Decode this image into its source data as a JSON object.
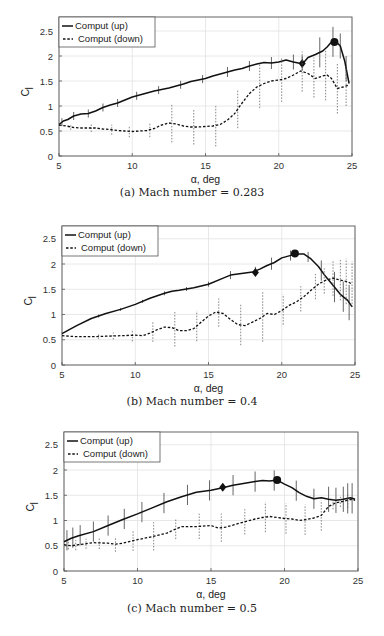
{
  "chart_data": [
    {
      "id": "a",
      "type": "line",
      "caption": "(a) Mach number = 0.283",
      "xlabel": "α, deg",
      "ylabel": "C",
      "ylabel_sub": "l",
      "xlim": [
        5,
        25
      ],
      "ylim": [
        0,
        2.8
      ],
      "xticks": [
        5,
        10,
        15,
        20,
        25
      ],
      "yticks": [
        0,
        0.5,
        1,
        1.5,
        2,
        2.5
      ],
      "grid": true,
      "legend": {
        "position": "upper-left",
        "entries": [
          "Comput (up)",
          "Comput (down)"
        ]
      },
      "frame": {
        "left": 59,
        "right": 352,
        "top": 17,
        "bottom": 156,
        "y0px": 156,
        "pxPerUnit": 50
      },
      "series": [
        {
          "name": "Comput (up)",
          "style": "solid",
          "x": [
            5,
            5.3,
            5.6,
            6,
            6.5,
            7,
            7.5,
            8,
            8.5,
            9,
            9.5,
            10,
            10.5,
            11,
            11.5,
            12,
            12.5,
            13,
            13.5,
            14,
            14.5,
            15,
            15.5,
            16,
            16.5,
            17,
            17.5,
            18,
            18.5,
            19,
            19.5,
            20,
            20.5,
            21,
            21.5,
            21.7,
            22,
            22.5,
            23,
            23.3,
            23.6,
            23.9,
            24.2,
            24.5,
            24.8
          ],
          "y": [
            0.63,
            0.7,
            0.73,
            0.8,
            0.84,
            0.85,
            0.9,
            0.97,
            1.02,
            1.06,
            1.12,
            1.18,
            1.22,
            1.26,
            1.3,
            1.33,
            1.36,
            1.4,
            1.44,
            1.49,
            1.52,
            1.55,
            1.6,
            1.64,
            1.68,
            1.72,
            1.75,
            1.8,
            1.84,
            1.87,
            1.86,
            1.88,
            1.92,
            1.88,
            1.85,
            1.87,
            1.97,
            2.03,
            2.1,
            2.18,
            2.28,
            2.29,
            2.2,
            1.9,
            1.45
          ],
          "error_bars": {
            "x": [
              5.2,
              6,
              7,
              8,
              9,
              10.3,
              11.8,
              13.3,
              14.8,
              16.5,
              18,
              19.5,
              21,
              21.6,
              22.8,
              23.7,
              24.2,
              24.6
            ],
            "half": [
              0.08,
              0.08,
              0.08,
              0.08,
              0.08,
              0.08,
              0.08,
              0.08,
              0.08,
              0.1,
              0.1,
              0.12,
              0.15,
              0.15,
              0.3,
              0.3,
              0.25,
              0.25
            ]
          },
          "markers": [
            {
              "x": 21.6,
              "y": 1.85,
              "shape": "diamond"
            },
            {
              "x": 23.8,
              "y": 2.28,
              "shape": "circle"
            }
          ]
        },
        {
          "name": "Comput (down)",
          "style": "dashed",
          "x": [
            5,
            5.5,
            6,
            6.5,
            7,
            7.5,
            8,
            8.5,
            9,
            9.5,
            10,
            10.5,
            11,
            11.5,
            12,
            12.5,
            13,
            13.5,
            14,
            14.5,
            15,
            15.5,
            16,
            16.5,
            17,
            17.3,
            17.6,
            18,
            18.5,
            19,
            19.5,
            20,
            20.5,
            21,
            21.5,
            22,
            22.5,
            23,
            23.3,
            23.6,
            24,
            24.4,
            24.8
          ],
          "y": [
            0.62,
            0.6,
            0.57,
            0.56,
            0.56,
            0.56,
            0.54,
            0.53,
            0.51,
            0.5,
            0.49,
            0.5,
            0.51,
            0.55,
            0.62,
            0.66,
            0.64,
            0.6,
            0.58,
            0.58,
            0.59,
            0.6,
            0.63,
            0.72,
            0.85,
            0.98,
            1.1,
            1.25,
            1.38,
            1.45,
            1.5,
            1.52,
            1.55,
            1.62,
            1.7,
            1.65,
            1.55,
            1.6,
            1.62,
            1.55,
            1.35,
            1.38,
            1.42
          ],
          "error_bars": {
            "x": [
              5.8,
              7.2,
              8.6,
              9.8,
              11.2,
              12.7,
              14.2,
              15.7,
              17.2,
              18.7,
              20.2,
              21.6,
              22.4,
              23.2,
              24,
              24.6
            ],
            "half": [
              0.06,
              0.08,
              0.1,
              0.12,
              0.15,
              0.38,
              0.35,
              0.42,
              0.38,
              0.45,
              0.45,
              0.4,
              0.4,
              0.5,
              0.5,
              0.4
            ]
          },
          "markers": []
        }
      ]
    },
    {
      "id": "b",
      "type": "line",
      "caption": "(b) Mach number = 0.4",
      "xlabel": "α, deg",
      "ylabel": "C",
      "ylabel_sub": "l",
      "xlim": [
        5,
        25
      ],
      "ylim": [
        0,
        2.8
      ],
      "xticks": [
        5,
        10,
        15,
        20,
        25
      ],
      "yticks": [
        0,
        0.5,
        1,
        1.5,
        2,
        2.5
      ],
      "grid": true,
      "legend": {
        "position": "upper-left",
        "entries": [
          "Comput (up)",
          "Comput (down)"
        ]
      },
      "frame": {
        "left": 62,
        "right": 355,
        "top": 16,
        "bottom": 155,
        "y0px": 155,
        "pxPerUnit": 50.5
      },
      "series": [
        {
          "name": "Comput (up)",
          "style": "solid",
          "x": [
            5,
            5.5,
            6,
            7,
            8,
            9,
            10,
            11,
            12,
            12.5,
            13,
            14,
            15,
            16,
            16.5,
            17,
            17.5,
            18,
            18.5,
            19,
            19.5,
            20,
            20.5,
            21,
            21.5,
            22,
            22.5,
            23,
            23.5,
            24,
            24.5,
            24.8
          ],
          "y": [
            0.62,
            0.7,
            0.78,
            0.92,
            1.02,
            1.1,
            1.2,
            1.32,
            1.42,
            1.46,
            1.48,
            1.53,
            1.6,
            1.72,
            1.78,
            1.8,
            1.82,
            1.84,
            1.9,
            1.97,
            2.03,
            2.12,
            2.16,
            2.2,
            2.2,
            2.1,
            1.95,
            1.75,
            1.58,
            1.4,
            1.28,
            1.15
          ],
          "error_bars": {
            "x": [
              7.5,
              9,
              10.5,
              12,
              13.5,
              15,
              16.5,
              18.2,
              19.3,
              20.6,
              21.8,
              22.7,
              23.6,
              24.2,
              24.6
            ],
            "half": [
              0.03,
              0.03,
              0.03,
              0.04,
              0.04,
              0.05,
              0.08,
              0.08,
              0.12,
              0.1,
              0.1,
              0.2,
              0.3,
              0.3,
              0.35
            ]
          },
          "markers": [
            {
              "x": 18.2,
              "y": 1.83,
              "shape": "diamond"
            },
            {
              "x": 20.9,
              "y": 2.21,
              "shape": "circle"
            }
          ]
        },
        {
          "name": "Comput (down)",
          "style": "dashed",
          "x": [
            5,
            6,
            7,
            8,
            9,
            10,
            10.5,
            11,
            11.5,
            12,
            12.5,
            13,
            13.5,
            14,
            14.5,
            15,
            15.5,
            16,
            16.5,
            17,
            17.5,
            18,
            18.5,
            19,
            19.5,
            20,
            20.5,
            21,
            21.5,
            22,
            22.5,
            23,
            23.5,
            24,
            24.5,
            24.8
          ],
          "y": [
            0.58,
            0.56,
            0.56,
            0.57,
            0.58,
            0.59,
            0.58,
            0.63,
            0.7,
            0.75,
            0.74,
            0.68,
            0.68,
            0.72,
            0.85,
            0.97,
            1.05,
            1.02,
            0.9,
            0.8,
            0.78,
            0.85,
            0.92,
            1.02,
            1.0,
            1.08,
            1.18,
            1.25,
            1.35,
            1.48,
            1.6,
            1.68,
            1.72,
            1.68,
            1.65,
            1.6
          ],
          "error_bars": {
            "x": [
              7.5,
              8.5,
              9.8,
              11.2,
              12.7,
              14.2,
              15.7,
              17.2,
              18.7,
              20.1,
              21.3,
              22.3,
              22.9,
              23.5,
              24,
              24.4,
              24.8
            ],
            "half": [
              0.05,
              0.07,
              0.12,
              0.2,
              0.35,
              0.3,
              0.28,
              0.4,
              0.5,
              0.3,
              0.25,
              0.25,
              0.25,
              0.35,
              0.4,
              0.45,
              0.45
            ]
          },
          "markers": []
        }
      ]
    },
    {
      "id": "c",
      "type": "line",
      "caption": "(c) Mach number = 0.5",
      "xlabel": "α, deg",
      "ylabel": "C",
      "ylabel_sub": "l",
      "xlim": [
        5,
        25
      ],
      "ylim": [
        0,
        2.8
      ],
      "xticks": [
        5,
        10,
        15,
        20,
        25
      ],
      "yticks": [
        0,
        0.5,
        1,
        1.5,
        2,
        2.5
      ],
      "grid": true,
      "legend": {
        "position": "upper-left",
        "entries": [
          "Comput (up)",
          "Comput (down)"
        ]
      },
      "frame": {
        "left": 64,
        "right": 358,
        "top": 16,
        "bottom": 155,
        "y0px": 155,
        "pxPerUnit": 50.5
      },
      "series": [
        {
          "name": "Comput (up)",
          "style": "solid",
          "x": [
            5,
            5.5,
            6,
            7,
            8,
            9,
            10,
            11,
            12,
            13,
            14,
            15,
            15.8,
            16.5,
            17,
            18,
            18.5,
            19,
            19.5,
            20,
            20.5,
            21,
            21.5,
            22,
            22.5,
            23,
            23.5,
            24,
            24.5,
            24.8
          ],
          "y": [
            0.58,
            0.65,
            0.7,
            0.78,
            0.9,
            1.02,
            1.13,
            1.25,
            1.37,
            1.47,
            1.56,
            1.6,
            1.65,
            1.7,
            1.72,
            1.77,
            1.79,
            1.78,
            1.8,
            1.72,
            1.65,
            1.55,
            1.48,
            1.43,
            1.45,
            1.42,
            1.4,
            1.42,
            1.45,
            1.42
          ],
          "error_bars": {
            "x": [
              5.2,
              5.6,
              6.1,
              7,
              8,
              9.1,
              10.3,
              11.8,
              13.4,
              14.9,
              16.5,
              18,
              19.3,
              20.8,
              22,
              23,
              23.5,
              24,
              24.3,
              24.6
            ],
            "half": [
              0.2,
              0.2,
              0.2,
              0.2,
              0.2,
              0.2,
              0.2,
              0.2,
              0.2,
              0.2,
              0.2,
              0.2,
              0.2,
              0.2,
              0.2,
              0.25,
              0.25,
              0.25,
              0.3,
              0.3
            ]
          },
          "markers": [
            {
              "x": 15.8,
              "y": 1.66,
              "shape": "diamond"
            },
            {
              "x": 19.5,
              "y": 1.8,
              "shape": "circle"
            }
          ]
        },
        {
          "name": "Comput (down)",
          "style": "dashed",
          "x": [
            5,
            5.5,
            6,
            7,
            8,
            8.5,
            9,
            10,
            11,
            12,
            12.5,
            13,
            14,
            15,
            15.5,
            16,
            17,
            18,
            18.5,
            19,
            19.5,
            20,
            20.5,
            21,
            21.5,
            22,
            22.5,
            23,
            23.5,
            24,
            24.5,
            24.8
          ],
          "y": [
            0.52,
            0.5,
            0.52,
            0.56,
            0.55,
            0.53,
            0.55,
            0.62,
            0.68,
            0.75,
            0.82,
            0.88,
            0.88,
            0.9,
            0.85,
            0.87,
            0.95,
            1.03,
            1.06,
            1.08,
            1.06,
            1.04,
            1.03,
            1.0,
            1.02,
            1.05,
            1.1,
            1.28,
            1.35,
            1.38,
            1.42,
            1.4
          ],
          "error_bars": {
            "x": [
              5.3,
              5.8,
              6.5,
              7.4,
              8.5,
              9.7,
              11.1,
              12.6,
              14.2,
              15.7,
              17.3,
              18.7,
              20.1,
              21.4,
              22.5,
              23.3,
              23.8,
              24.3
            ],
            "half": [
              0.08,
              0.1,
              0.1,
              0.12,
              0.15,
              0.2,
              0.28,
              0.2,
              0.25,
              0.28,
              0.25,
              0.3,
              0.3,
              0.3,
              0.3,
              0.1,
              0.1,
              0.15
            ]
          },
          "markers": []
        }
      ]
    }
  ]
}
